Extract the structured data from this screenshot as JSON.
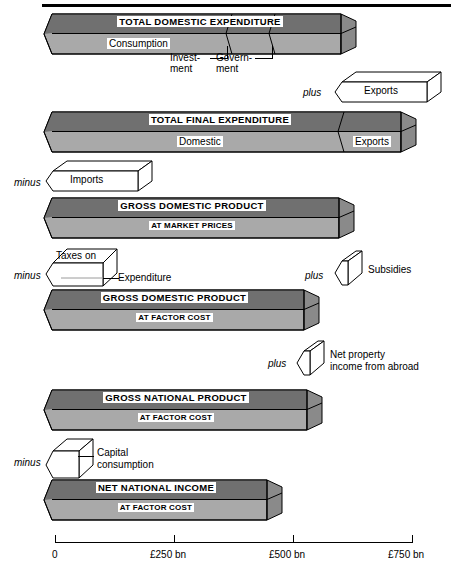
{
  "diagram": {
    "units": "£ bn",
    "axis": {
      "ticks": [
        {
          "label": "0",
          "value": 0
        },
        {
          "label": "£250 bn",
          "value": 250
        },
        {
          "label": "£500 bn",
          "value": 500
        },
        {
          "label": "£750 bn",
          "value": 750
        }
      ],
      "min": 0,
      "max": 750
    },
    "operators": {
      "plus": "plus",
      "minus": "minus"
    },
    "bars": [
      {
        "id": "total-domestic-expenditure",
        "title": "TOTAL DOMESTIC EXPENDITURE",
        "subtitle": "",
        "value": 620,
        "segments": [
          {
            "label": "Consumption",
            "value": 395
          },
          {
            "label": "Invest-\nment",
            "value": 90
          },
          {
            "label": "Govern-\nment",
            "value": 135
          }
        ]
      },
      {
        "id": "total-final-expenditure",
        "title": "TOTAL FINAL EXPENDITURE",
        "subtitle": "",
        "value": 760,
        "segments": [
          {
            "label": "Domestic",
            "value": 620
          },
          {
            "label": "Exports",
            "value": 140
          }
        ]
      },
      {
        "id": "gross-domestic-product-market-prices",
        "title": "GROSS DOMESTIC PRODUCT",
        "subtitle": "AT MARKET PRICES",
        "value": 615,
        "segments": []
      },
      {
        "id": "gross-domestic-product-factor-cost",
        "title": "GROSS DOMESTIC PRODUCT",
        "subtitle": "AT FACTOR COST",
        "value": 540,
        "segments": []
      },
      {
        "id": "gross-national-product-factor-cost",
        "title": "GROSS NATIONAL PRODUCT",
        "subtitle": "AT FACTOR COST",
        "value": 548,
        "segments": []
      },
      {
        "id": "net-national-income-factor-cost",
        "title": "NET NATIONAL INCOME",
        "subtitle": "AT FACTOR COST",
        "value": 465,
        "segments": []
      }
    ],
    "adjustments": [
      {
        "id": "exports",
        "operator": "plus",
        "label": "Exports",
        "value": 140
      },
      {
        "id": "imports",
        "operator": "minus",
        "label": "Imports",
        "value": 145
      },
      {
        "id": "taxes-on-expenditure",
        "operator": "minus",
        "label_line1": "Taxes on",
        "label_line2": "Expenditure",
        "value": 95
      },
      {
        "id": "subsidies",
        "operator": "plus",
        "label": "Subsidies",
        "value": 20
      },
      {
        "id": "net-property-income-from-abroad",
        "operator": "plus",
        "label_line1": "Net property",
        "label_line2": "income from abroad",
        "value": 8
      },
      {
        "id": "capital-consumption",
        "operator": "minus",
        "label_line1": "Capital",
        "label_line2": "consumption",
        "value": 83
      }
    ],
    "colors": {
      "bar_top": "#707070",
      "bar_bottom": "#b9b9b9",
      "bar_cap": "#8a8a8a",
      "outline": "#000000",
      "background": "#ffffff"
    }
  }
}
